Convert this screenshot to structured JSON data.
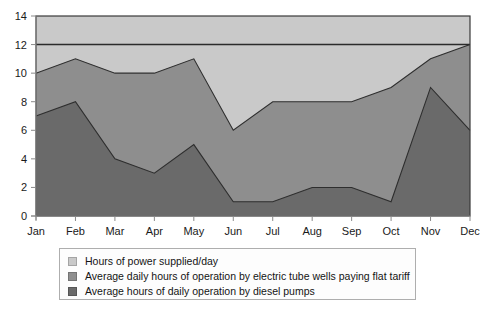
{
  "chart_data": {
    "type": "area",
    "title": "",
    "subtitle": "",
    "xlabel": "",
    "ylabel": "",
    "categories": [
      "Jan",
      "Feb",
      "Mar",
      "Apr",
      "May",
      "Jun",
      "Jul",
      "Aug",
      "Sep",
      "Oct",
      "Nov",
      "Dec"
    ],
    "ylim": [
      0,
      14
    ],
    "yticks": [
      0,
      2,
      4,
      6,
      8,
      10,
      12,
      14
    ],
    "grid": false,
    "stacked": false,
    "legend_position": "bottom",
    "series": [
      {
        "name": "Hours of power supplied/day",
        "color": "#c9c9c9",
        "values": [
          14,
          14,
          14,
          14,
          14,
          14,
          14,
          14,
          14,
          14,
          14,
          14
        ]
      },
      {
        "name": "Average daily hours of operation by electric tube wells paying flat tariff",
        "color": "#8e8e8e",
        "values": [
          10,
          11,
          10,
          10,
          11,
          6,
          8,
          8,
          8,
          9,
          11,
          12
        ]
      },
      {
        "name": "Average hours of daily operation by diesel pumps",
        "color": "#6a6a6a",
        "values": [
          7,
          8,
          4,
          3,
          5,
          1,
          1,
          2,
          2,
          1,
          9,
          6
        ]
      }
    ],
    "reference_line": {
      "value": 12,
      "color": "#2b2b2b"
    },
    "annotations": []
  },
  "axis": {
    "y_tick_labels": [
      "0",
      "2",
      "4",
      "6",
      "8",
      "10",
      "12",
      "14"
    ],
    "x_tick_labels": [
      "Jan",
      "Feb",
      "Mar",
      "Apr",
      "May",
      "Jun",
      "Jul",
      "Aug",
      "Sep",
      "Oct",
      "Nov",
      "Dec"
    ]
  },
  "legend": {
    "items": [
      {
        "label": "Hours of power supplied/day",
        "color": "#c9c9c9"
      },
      {
        "label": "Average daily hours of operation by electric tube wells paying flat tariff",
        "color": "#8e8e8e"
      },
      {
        "label": "Average hours of daily operation by diesel pumps",
        "color": "#6a6a6a"
      }
    ]
  },
  "colors": {
    "plot_border": "#3a3a3a",
    "axis_line": "#8a8a8a",
    "background": "#ffffff",
    "band_top": "#c9c9c9",
    "band_mid": "#8e8e8e",
    "band_bottom": "#6a6a6a"
  }
}
